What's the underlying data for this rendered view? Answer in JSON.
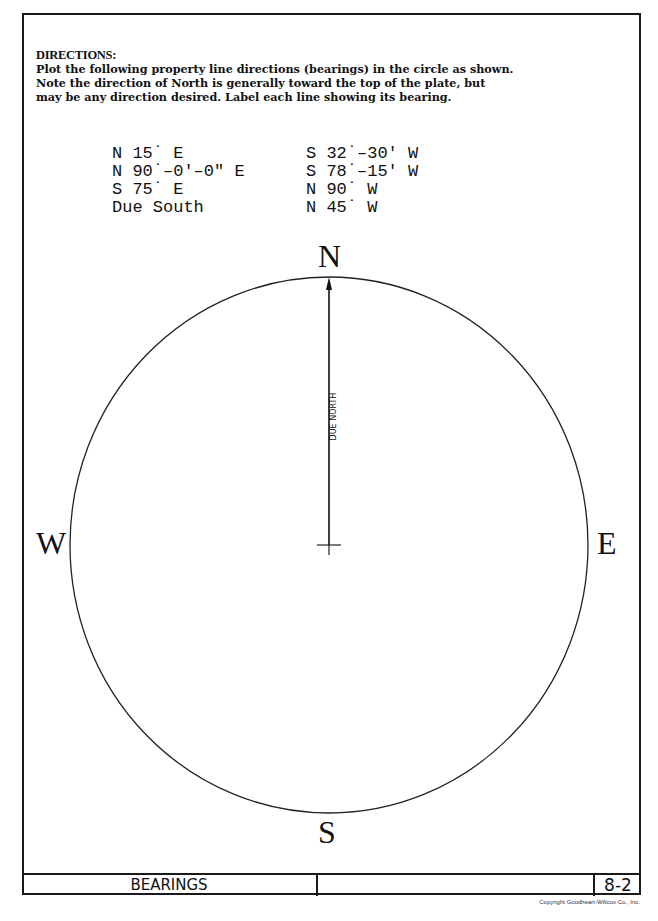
{
  "directions": {
    "heading": "DIRECTIONS:",
    "lines": [
      "Plot the following property line directions (bearings) in the circle as shown.",
      "Note the direction of North is generally toward the top of the plate, but",
      "may be any direction desired.  Label each line showing its bearing."
    ]
  },
  "bearings": {
    "column1": [
      "N 15˙ E",
      "N 90˙–0'–0\" E",
      "S 75˙ E",
      "Due South"
    ],
    "column2": [
      "S 32˙–30' W",
      "S 78˙–15' W",
      "N 90˙ W",
      "N 45˙ W"
    ]
  },
  "compass": {
    "north": "N",
    "south": "S",
    "east": "E",
    "west": "W",
    "example_line_label": "DUE NORTH"
  },
  "title_block": {
    "title": "BEARINGS",
    "plate_number": "8-2"
  },
  "copyright": "Copyright Goodheart-Willcox Co., Inc."
}
